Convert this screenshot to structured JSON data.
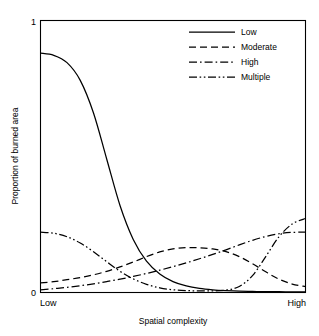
{
  "chart_data": {
    "type": "line",
    "title": "",
    "subtitle": "",
    "xlabel": "Spatial complexity",
    "ylabel": "Proportion of burned area",
    "xlim": [
      0,
      1
    ],
    "ylim": [
      0,
      1
    ],
    "grid": false,
    "x_tick_labels": [
      "Low",
      "High"
    ],
    "x_tick_values": [
      0,
      1
    ],
    "y_tick_labels": [
      "0",
      "1"
    ],
    "y_tick_values": [
      0,
      1
    ],
    "legend_position": "top-right",
    "legend_entries": [
      {
        "label": "Low",
        "style": "solid"
      },
      {
        "label": "Moderate",
        "style": "dashed"
      },
      {
        "label": "High",
        "style": "dash-dot"
      },
      {
        "label": "Multiple",
        "style": "dash-dot-dot"
      }
    ],
    "x": [
      0.0,
      0.05,
      0.1,
      0.15,
      0.2,
      0.25,
      0.3,
      0.35,
      0.4,
      0.45,
      0.5,
      0.55,
      0.6,
      0.65,
      0.7,
      0.75,
      0.8,
      0.85,
      0.9,
      0.95,
      1.0
    ],
    "series": [
      {
        "name": "Low",
        "style": "solid",
        "values": [
          0.88,
          0.872,
          0.845,
          0.78,
          0.66,
          0.49,
          0.32,
          0.195,
          0.115,
          0.068,
          0.04,
          0.024,
          0.015,
          0.01,
          0.007,
          0.005,
          0.004,
          0.003,
          0.003,
          0.002,
          0.002
        ]
      },
      {
        "name": "Moderate",
        "style": "dashed",
        "values": [
          0.035,
          0.04,
          0.047,
          0.055,
          0.065,
          0.078,
          0.094,
          0.112,
          0.132,
          0.149,
          0.16,
          0.165,
          0.164,
          0.16,
          0.15,
          0.132,
          0.106,
          0.076,
          0.049,
          0.031,
          0.022
        ]
      },
      {
        "name": "High",
        "style": "dash-dot",
        "values": [
          0.01,
          0.014,
          0.019,
          0.025,
          0.032,
          0.04,
          0.049,
          0.059,
          0.07,
          0.082,
          0.095,
          0.109,
          0.124,
          0.14,
          0.157,
          0.175,
          0.192,
          0.206,
          0.216,
          0.221,
          0.222
        ]
      },
      {
        "name": "Multiple",
        "style": "dash-dot-dot",
        "values": [
          0.222,
          0.218,
          0.205,
          0.182,
          0.15,
          0.113,
          0.078,
          0.05,
          0.03,
          0.017,
          0.01,
          0.007,
          0.006,
          0.006,
          0.009,
          0.022,
          0.062,
          0.132,
          0.205,
          0.252,
          0.272
        ]
      }
    ]
  }
}
